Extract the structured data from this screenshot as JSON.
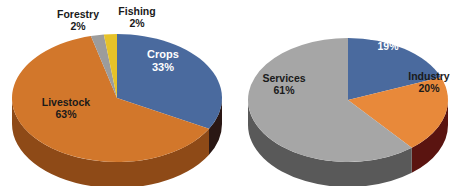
{
  "figure": {
    "background_color": "#ffffff",
    "width": 469,
    "height": 186
  },
  "chart_data": [
    {
      "id": "agriculture-composition",
      "type": "pie",
      "title": "",
      "three_d": true,
      "start_angle_deg": 0,
      "direction": "clockwise",
      "legend": "none",
      "labels_position": "inside-and-outside",
      "categories": [
        "Crops",
        "Livestock",
        "Forestry",
        "Fishing"
      ],
      "values": [
        33,
        63,
        2,
        2
      ],
      "value_unit": "%",
      "colors": [
        "#4A6A9E",
        "#D2772B",
        "#9C9C9C",
        "#E6C229"
      ],
      "side_colors": [
        "#1F2E52",
        "#8E4A17",
        "#5E5E5E",
        "#9A7F12"
      ],
      "slices": [
        {
          "label": "Crops",
          "value": 33,
          "display": "33%",
          "color": "#4A6A9E",
          "side_color": "#2A1714",
          "label_color": "#ffffff"
        },
        {
          "label": "Livestock",
          "value": 63,
          "display": "63%",
          "color": "#D2772B",
          "side_color": "#8E4A17",
          "label_color": "#1a1a1a"
        },
        {
          "label": "Forestry",
          "value": 2,
          "display": "2%",
          "color": "#9C9C9C",
          "side_color": "#5E5E5E",
          "label_color": "#1a1a1a"
        },
        {
          "label": "Fishing",
          "value": 2,
          "display": "2%",
          "color": "#E6C229",
          "side_color": "#9A7F12",
          "label_color": "#1a1a1a"
        }
      ]
    },
    {
      "id": "gdp-sector-composition",
      "type": "pie",
      "title": "",
      "three_d": true,
      "start_angle_deg": 0,
      "direction": "clockwise",
      "legend": "none",
      "labels_position": "inside",
      "categories": [
        "Agriculure",
        "Industry",
        "Services"
      ],
      "values": [
        19,
        20,
        61
      ],
      "value_unit": "%",
      "colors": [
        "#4A6A9E",
        "#E8893A",
        "#A6A6A6"
      ],
      "side_colors": [
        "#2A1714",
        "#5A1410",
        "#595959"
      ],
      "slices": [
        {
          "label": "Agriculure",
          "value": 19,
          "display": "19%",
          "color": "#4A6A9E",
          "side_color": "#2A1714",
          "label_color": "#ffffff"
        },
        {
          "label": "Industry",
          "value": 20,
          "display": "20%",
          "color": "#E8893A",
          "side_color": "#5A1410",
          "label_color": "#1a1a1a"
        },
        {
          "label": "Services",
          "value": 61,
          "display": "61%",
          "color": "#A6A6A6",
          "side_color": "#595959",
          "label_color": "#1a1a1a"
        }
      ]
    }
  ],
  "left_chart": {
    "forestry": {
      "name": "Forestry",
      "pct": "2%"
    },
    "fishing": {
      "name": "Fishing",
      "pct": "2%"
    },
    "crops": {
      "name": "Crops",
      "pct": "33%"
    },
    "livestock": {
      "name": "Livestock",
      "pct": "63%"
    }
  },
  "right_chart": {
    "agriculture": {
      "name": "Agriculure",
      "pct": "19%"
    },
    "industry": {
      "name": "Industry",
      "pct": "20%"
    },
    "services": {
      "name": "Services",
      "pct": "61%"
    }
  }
}
